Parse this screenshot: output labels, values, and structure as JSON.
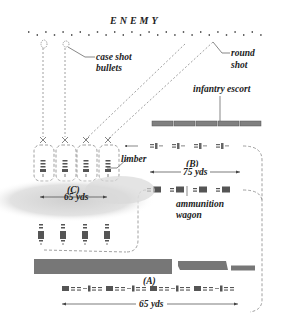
{
  "diagram": {
    "title": "ENEMY",
    "labels": {
      "case_shot": [
        "case shot",
        "bullets"
      ],
      "round_shot": [
        "round",
        "shot"
      ],
      "infantry_escort": "infantry escort",
      "limber": "limber",
      "ammunition_wagon": [
        "ammunition",
        "wagon"
      ],
      "section_b": "(B)",
      "section_c": "(C)",
      "section_a": "(A)",
      "dist_b": "75 yds",
      "dist_c": "65 yds",
      "dist_a": "65 yds"
    },
    "colors": {
      "text": "#222222",
      "line": "#555555",
      "dashed": "#777777",
      "smoke": "#d8d8d8",
      "unit_fill": "#7a7a7a",
      "infantry_fill": "#808080",
      "vehicle": "#555555"
    }
  }
}
